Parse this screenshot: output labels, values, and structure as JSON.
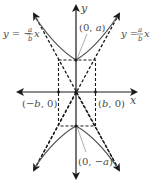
{
  "diagram": {
    "type": "hyperbola-vertical",
    "axes": {
      "x_label": "x",
      "y_label": "y"
    },
    "vertices": [
      {
        "label_open": "(0, ",
        "label_var": "a",
        "label_close": ")"
      },
      {
        "label_open": "(0, ",
        "label_var": "−a",
        "label_close": ")"
      }
    ],
    "co_vertices": [
      {
        "label_open": "(",
        "label_var": "−b",
        "label_close": ", 0)"
      },
      {
        "label_open": "(",
        "label_var": "b",
        "label_close": ", 0)"
      }
    ],
    "asymptotes": [
      {
        "lhs": "y = −",
        "num": "a",
        "den": "b",
        "rhs": "x"
      },
      {
        "lhs": "y = ",
        "num": "a",
        "den": "b",
        "rhs": "x"
      }
    ],
    "colors": {
      "axes": "#1a1a1a",
      "curve": "#555555",
      "dashed": "#1a1a1a",
      "text": "#4a4a4a"
    }
  }
}
